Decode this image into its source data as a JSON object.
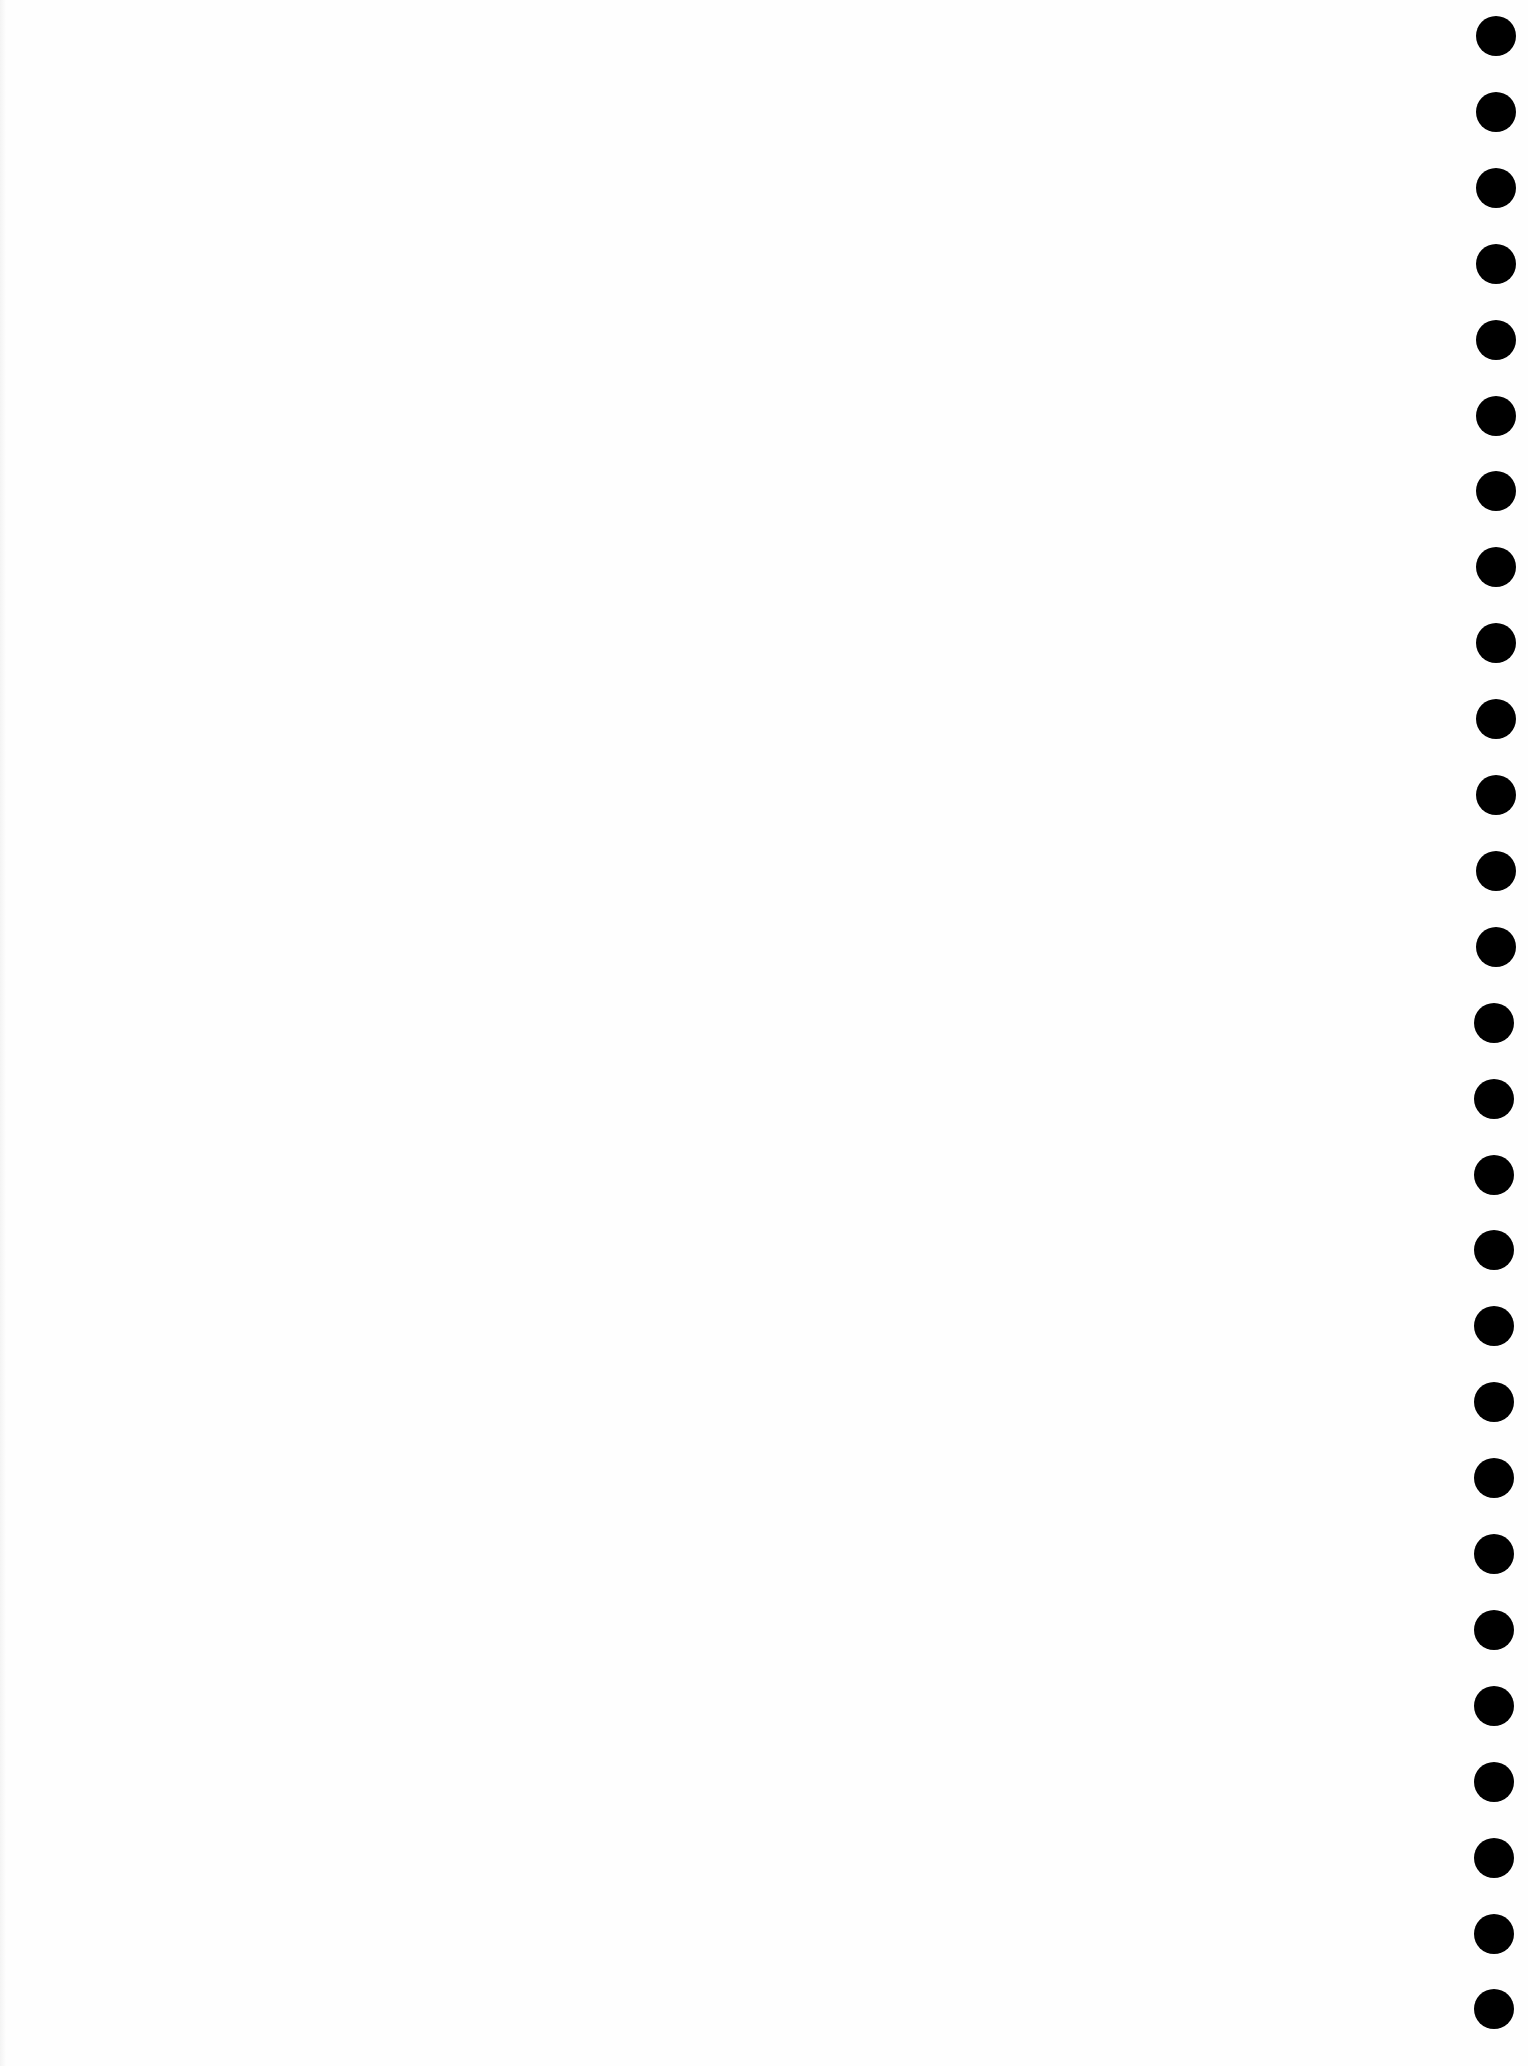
{
  "document": {
    "type": "blank-page",
    "background_color": "#fefefe"
  },
  "punch_holes": {
    "side": "right",
    "count": 27,
    "color": "#000000",
    "diameter_px": 40,
    "first_center_y": 36,
    "spacing_px": 75.9
  }
}
